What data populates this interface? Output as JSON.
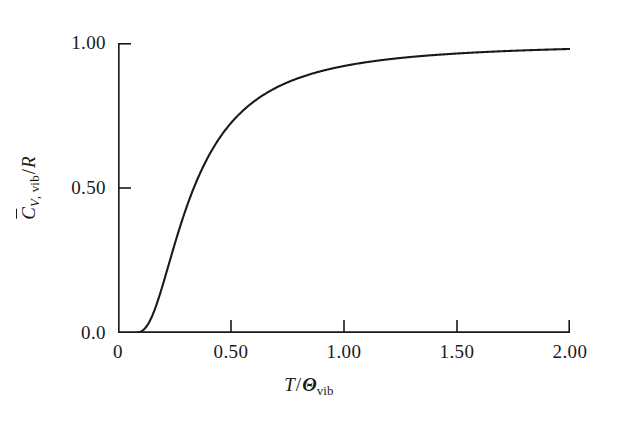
{
  "figure": {
    "background_color": "#ffffff",
    "line_color": "#1a1a1a",
    "axis_color": "#1a1a1a"
  },
  "axes": {
    "x_title_parts": {
      "variable": "T",
      "slash": "/",
      "theta": "Θ",
      "subscript": "vib"
    },
    "y_title_parts": {
      "variable": "C",
      "subscript_italic": "V",
      "subscript_rest": ", vib",
      "slash": "/",
      "denominator": "R"
    },
    "x_tick_labels": [
      "0",
      "0.50",
      "1.00",
      "1.50",
      "2.00"
    ],
    "y_tick_labels": [
      "0.0",
      "0.50",
      "1.00"
    ]
  },
  "chart_data": {
    "type": "line",
    "title": "",
    "subtitle": "",
    "xlabel": "T/Θ_vib",
    "ylabel": "C̄_{V,vib}/R",
    "xlim": [
      0,
      2.0
    ],
    "ylim": [
      0,
      1.0
    ],
    "grid": false,
    "legend": "none",
    "x_ticks": [
      0,
      0.5,
      1.0,
      1.5,
      2.0
    ],
    "x_tick_labels": [
      "0",
      "0.50",
      "1.00",
      "1.50",
      "2.00"
    ],
    "y_ticks": [
      0.0,
      0.5,
      1.0
    ],
    "y_tick_labels": [
      "0.0",
      "0.50",
      "1.00"
    ],
    "series": [
      {
        "name": "Einstein vibrational heat capacity",
        "equation": "(Θ/T)^2 e^{Θ/T} / (e^{Θ/T} - 1)^2",
        "x": [
          0.0,
          0.05,
          0.08,
          0.1,
          0.12,
          0.15,
          0.18,
          0.2,
          0.22,
          0.25,
          0.28,
          0.3,
          0.32,
          0.35,
          0.38,
          0.4,
          0.45,
          0.5,
          0.55,
          0.6,
          0.65,
          0.7,
          0.75,
          0.8,
          0.85,
          0.9,
          0.95,
          1.0,
          1.1,
          1.2,
          1.3,
          1.4,
          1.5,
          1.6,
          1.7,
          1.8,
          1.9,
          2.0
        ],
        "y": [
          0.0,
          0.0,
          0.002,
          0.005,
          0.012,
          0.035,
          0.071,
          0.099,
          0.13,
          0.179,
          0.229,
          0.262,
          0.294,
          0.34,
          0.383,
          0.41,
          0.472,
          0.525,
          0.57,
          0.609,
          0.643,
          0.671,
          0.696,
          0.718,
          0.737,
          0.754,
          0.769,
          0.782,
          0.805,
          0.824,
          0.839,
          0.852,
          0.863,
          0.872,
          0.88,
          0.887,
          0.893,
          0.898
        ]
      }
    ]
  }
}
